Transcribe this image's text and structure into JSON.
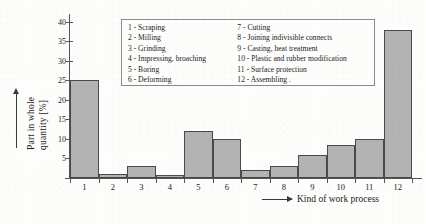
{
  "axes": {
    "y_title_line1": "Part in whole",
    "y_title_line2": "quantity [%]",
    "x_title": "Kind of work process"
  },
  "legend": {
    "column1": [
      "1 - Scraping",
      "2 - Milling",
      "3 - Grinding",
      "4 - Impressing, broaching",
      "5 - Boring",
      "6 - Deforming"
    ],
    "column2": [
      "7 - Cutting",
      "8 - Joining indivisible connects",
      "9 - Casting, heat treatment",
      "10 - Plastic and rubber modification",
      "11 - Surface protection",
      "12 - Assembling  ."
    ]
  },
  "chart_data": {
    "type": "bar",
    "title": "",
    "xlabel": "Kind of work process",
    "ylabel": "Part in whole quantity [%]",
    "categories": [
      "1",
      "2",
      "3",
      "4",
      "5",
      "6",
      "7",
      "8",
      "9",
      "10",
      "11",
      "12"
    ],
    "category_names": [
      "Scraping",
      "Milling",
      "Grinding",
      "Impressing, broaching",
      "Boring",
      "Deforming",
      "Cutting",
      "Joining indivisible connects",
      "Casting, heat treatment",
      "Plastic and rubber modification",
      "Surface protection",
      "Assembling"
    ],
    "values": [
      25,
      1,
      3,
      0.7,
      12,
      10,
      2,
      3,
      6,
      8.5,
      10,
      38
    ],
    "ylim": [
      0,
      42
    ],
    "yticks": [
      5,
      10,
      15,
      20,
      25,
      30,
      35,
      40
    ],
    "ytick_labels": [
      "5",
      "10",
      "15",
      "20",
      "25",
      "30",
      "35",
      "40"
    ],
    "grid": false,
    "legend_position": "inside-top-center",
    "bar_color": "#b3b3b3",
    "bar_edge_color": "#4a4a4a"
  }
}
